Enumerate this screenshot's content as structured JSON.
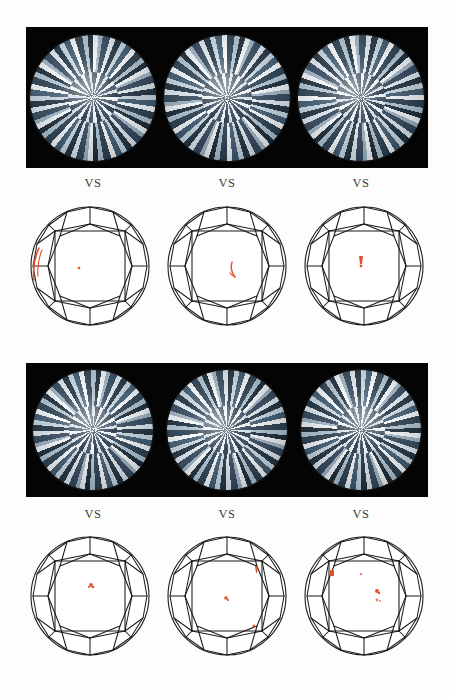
{
  "figure": {
    "background_color": "#fdfdfd",
    "photo_panel_color": "#040404",
    "plot_line_color": "#1b1b1b",
    "inclusion_color": "#e2512a",
    "gem_highlight_color": "#f2f6f9",
    "gem_shadow_color": "#20313f"
  },
  "groups": [
    {
      "group_id": "group-top",
      "photo_strip": {
        "name": "photo-strip-top",
        "background": "#040404",
        "gems": [
          {
            "name": "gem-photo-1",
            "shape": "round-brilliant",
            "view": "face-up"
          },
          {
            "name": "gem-photo-2",
            "shape": "round-brilliant",
            "view": "face-up"
          },
          {
            "name": "gem-photo-3",
            "shape": "round-brilliant",
            "view": "face-up"
          }
        ]
      },
      "captions": [
        {
          "label": "VS"
        },
        {
          "label": "VS"
        },
        {
          "label": "VS"
        }
      ],
      "plots": [
        {
          "name": "clarity-plot-1",
          "grade": "VS",
          "inclusions": [
            {
              "type": "feather",
              "shape": "arc",
              "x": 16,
              "y": 62,
              "size": 22
            },
            {
              "type": "crystal",
              "shape": "dot",
              "x": 56,
              "y": 70,
              "size": 2
            }
          ]
        },
        {
          "name": "clarity-plot-2",
          "grade": "VS",
          "inclusions": [
            {
              "type": "feather",
              "shape": "stroke",
              "x": 70,
              "y": 68,
              "size": 7
            }
          ]
        },
        {
          "name": "clarity-plot-3",
          "grade": "VS",
          "inclusions": [
            {
              "type": "crystal",
              "shape": "mark",
              "x": 62,
              "y": 62,
              "size": 5
            }
          ]
        }
      ]
    },
    {
      "group_id": "group-bottom",
      "photo_strip": {
        "name": "photo-strip-bottom",
        "background": "#040404",
        "gems": [
          {
            "name": "gem-photo-4",
            "shape": "round-brilliant",
            "view": "face-up"
          },
          {
            "name": "gem-photo-5",
            "shape": "round-brilliant",
            "view": "face-up"
          },
          {
            "name": "gem-photo-6",
            "shape": "round-brilliant",
            "view": "face-up"
          }
        ]
      },
      "captions": [
        {
          "label": "VS"
        },
        {
          "label": "VS"
        },
        {
          "label": "VS"
        }
      ],
      "plots": [
        {
          "name": "clarity-plot-4",
          "grade": "VS",
          "inclusions": [
            {
              "type": "crystal",
              "shape": "dot",
              "x": 66,
              "y": 58,
              "size": 3.2
            }
          ]
        },
        {
          "name": "clarity-plot-5",
          "grade": "VS",
          "inclusions": [
            {
              "type": "crystal",
              "shape": "dot",
              "x": 95,
              "y": 42,
              "size": 2.4
            },
            {
              "type": "crystal",
              "shape": "dot",
              "x": 64,
              "y": 70,
              "size": 2.6
            },
            {
              "type": "crystal",
              "shape": "dot",
              "x": 92,
              "y": 98,
              "size": 2.2
            }
          ]
        },
        {
          "name": "clarity-plot-6",
          "grade": "VS",
          "inclusions": [
            {
              "type": "crystal",
              "shape": "blob",
              "x": 33,
              "y": 45,
              "size": 3.6
            },
            {
              "type": "pinpoint",
              "shape": "dot",
              "x": 62,
              "y": 46,
              "size": 1.6
            },
            {
              "type": "crystal",
              "shape": "dot",
              "x": 78,
              "y": 64,
              "size": 3.0
            },
            {
              "type": "pinpoint",
              "shape": "dot",
              "x": 78,
              "y": 72,
              "size": 2.0
            }
          ]
        }
      ]
    }
  ]
}
